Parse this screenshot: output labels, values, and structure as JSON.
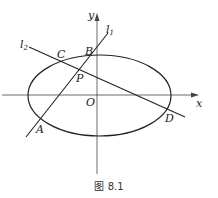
{
  "diagram": {
    "type": "ellipse-with-intersecting-lines",
    "axes": {
      "x_label": "x",
      "y_label": "y",
      "origin_label": "O"
    },
    "curve": "ellipse",
    "lines": [
      {
        "name": "l1",
        "label": "l",
        "subscript": "1",
        "through": [
          "A",
          "P",
          "B"
        ]
      },
      {
        "name": "l2",
        "label": "l",
        "subscript": "2",
        "through": [
          "C",
          "P",
          "D"
        ]
      }
    ],
    "points": {
      "A": "A",
      "B": "B",
      "C": "C",
      "D": "D",
      "P": "P",
      "O": "O"
    },
    "caption": "图 8.1"
  }
}
